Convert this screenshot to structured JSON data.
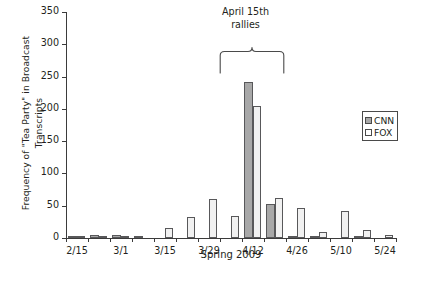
{
  "chart_data": {
    "type": "bar",
    "title": "",
    "xlabel": "Spring 2009",
    "ylabel": "Frequency of \"Tea Party\" in Broadcast Transcripts",
    "ylim": [
      0,
      350
    ],
    "yticks": [
      0,
      50,
      100,
      150,
      200,
      250,
      300,
      350
    ],
    "ytick_labels": [
      "0",
      "50",
      "100",
      "150",
      "200",
      "250",
      "300",
      "350"
    ],
    "grid": false,
    "legend_position": "right",
    "categories": [
      "2/15",
      "2/22",
      "3/1",
      "3/8",
      "3/15",
      "3/22",
      "3/29",
      "4/5",
      "4/12",
      "4/19",
      "4/26",
      "5/3",
      "5/10",
      "5/17",
      "5/24"
    ],
    "xtick_labels": [
      "2/15",
      "3/1",
      "3/15",
      "3/29",
      "4/12",
      "4/26",
      "5/10",
      "5/24"
    ],
    "series": [
      {
        "name": "CNN",
        "color": "#a8a8a8",
        "values": [
          2,
          5,
          4,
          1,
          0,
          0,
          0,
          0,
          242,
          52,
          2,
          1,
          0,
          2,
          0
        ]
      },
      {
        "name": "FOX",
        "color": "#f1f1f1",
        "values": [
          1,
          2,
          3,
          0,
          15,
          32,
          60,
          34,
          205,
          62,
          47,
          10,
          42,
          13,
          5
        ]
      }
    ],
    "annotations": [
      {
        "text": "April 15th rallies",
        "text_line1": "April 15th",
        "text_line2": "rallies",
        "brace_span": [
          "4/12",
          "4/19"
        ]
      }
    ]
  },
  "legend": {
    "items": [
      {
        "label": "CNN",
        "swatch": "gray"
      },
      {
        "label": "FOX",
        "swatch": "white"
      }
    ]
  },
  "annotation": {
    "line1": "April 15th",
    "line2": "rallies"
  },
  "axes": {
    "y_title": "Frequency of \"Tea Party\" in Broadcast Transcripts",
    "x_title": "Spring 2009"
  }
}
